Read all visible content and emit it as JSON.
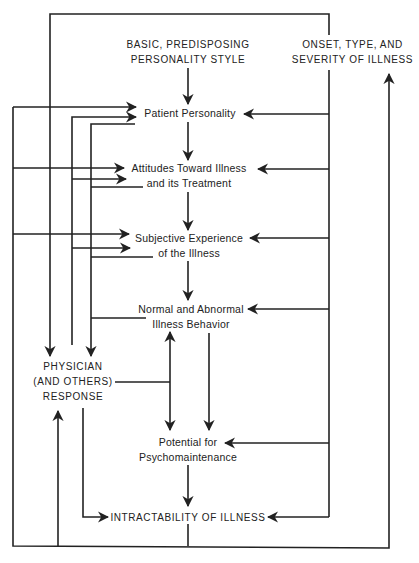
{
  "diagram": {
    "type": "flow-diagram",
    "nodes": {
      "basic_style": {
        "line1": "BASIC, PREDISPOSING",
        "line2": "PERSONALITY STYLE"
      },
      "onset": {
        "line1": "ONSET, TYPE, AND",
        "line2": "SEVERITY OF ILLNESS"
      },
      "patient_personality": {
        "line1": "Patient Personality"
      },
      "attitudes": {
        "line1": "Attitudes Toward Illness",
        "line2": "and its Treatment"
      },
      "subjective": {
        "line1": "Subjective Experience",
        "line2": "of the Illness"
      },
      "behavior": {
        "line1": "Normal and Abnormal",
        "line2": "Illness Behavior"
      },
      "physician": {
        "line1": "PHYSICIAN",
        "line2": "(AND OTHERS)",
        "line3": "RESPONSE"
      },
      "potential": {
        "line1": "Potential for",
        "line2": "Psychomaintenance"
      },
      "intractability": {
        "line1": "INTRACTABILITY OF ILLNESS"
      }
    },
    "edges": [
      {
        "from": "basic_style",
        "to": "patient_personality"
      },
      {
        "from": "patient_personality",
        "to": "attitudes"
      },
      {
        "from": "attitudes",
        "to": "subjective"
      },
      {
        "from": "subjective",
        "to": "behavior"
      },
      {
        "from": "behavior",
        "to": "potential"
      },
      {
        "from": "potential",
        "to": "intractability"
      },
      {
        "from": "onset",
        "to": "patient_personality"
      },
      {
        "from": "onset",
        "to": "attitudes"
      },
      {
        "from": "onset",
        "to": "subjective"
      },
      {
        "from": "onset",
        "to": "behavior"
      },
      {
        "from": "onset",
        "to": "potential"
      },
      {
        "from": "onset",
        "to": "intractability"
      },
      {
        "from": "onset",
        "to": "physician"
      },
      {
        "from": "physician",
        "to": "patient_personality"
      },
      {
        "from": "physician",
        "to": "attitudes"
      },
      {
        "from": "physician",
        "to": "subjective"
      },
      {
        "from": "physician",
        "to": "behavior"
      },
      {
        "from": "physician",
        "to": "potential"
      },
      {
        "from": "physician",
        "to": "intractability"
      },
      {
        "from": "patient_personality",
        "to": "physician"
      },
      {
        "from": "attitudes",
        "to": "physician"
      },
      {
        "from": "subjective",
        "to": "physician"
      },
      {
        "from": "behavior",
        "to": "physician"
      },
      {
        "from": "intractability",
        "to": "physician"
      },
      {
        "from": "intractability",
        "to": "onset"
      },
      {
        "from": "intractability",
        "to": "patient_personality"
      },
      {
        "from": "intractability",
        "to": "attitudes"
      },
      {
        "from": "intractability",
        "to": "subjective"
      }
    ],
    "colors": {
      "ink": "#222222",
      "background": "#ffffff"
    }
  }
}
